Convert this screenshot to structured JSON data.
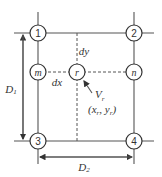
{
  "diagram": {
    "type": "grid-interpolation-schematic",
    "nodes": [
      {
        "id": "1",
        "label": "1",
        "kind": "corner",
        "x": 38,
        "y": 33
      },
      {
        "id": "2",
        "label": "2",
        "kind": "corner",
        "x": 134,
        "y": 33
      },
      {
        "id": "3",
        "label": "3",
        "kind": "corner",
        "x": 38,
        "y": 141
      },
      {
        "id": "4",
        "label": "4",
        "kind": "corner",
        "x": 134,
        "y": 141
      },
      {
        "id": "m",
        "label": "m",
        "kind": "intermediate",
        "x": 38,
        "y": 72
      },
      {
        "id": "n",
        "label": "n",
        "kind": "intermediate",
        "x": 134,
        "y": 72
      },
      {
        "id": "r",
        "label": "r",
        "kind": "interpolated",
        "x": 77,
        "y": 72
      }
    ],
    "labels": {
      "dy": "dy",
      "dx": "dx",
      "vr_main": "V",
      "vr_sub": "r",
      "coord_open": "(x",
      "coord_xsub": "r",
      "coord_mid": ", y",
      "coord_ysub": "r",
      "coord_close": ")",
      "d1_main": "D",
      "d1_sub": "1",
      "d2_main": "D",
      "d2_sub": "2"
    },
    "colors": {
      "stroke": "#555555",
      "node_stroke": "#333333",
      "text": "#333333",
      "background": "#ffffff"
    }
  }
}
